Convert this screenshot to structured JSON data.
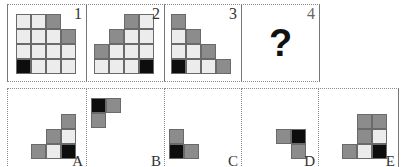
{
  "puzzle": {
    "question_panels": [
      {
        "label": "1",
        "grid": [
          [
            "l",
            "l",
            "g",
            ""
          ],
          [
            "l",
            "l",
            "l",
            "g"
          ],
          [
            "l",
            "l",
            "l",
            "l"
          ],
          [
            "b",
            "l",
            "l",
            "l"
          ]
        ]
      },
      {
        "label": "2",
        "grid": [
          [
            "",
            "",
            "g",
            "l"
          ],
          [
            "",
            "g",
            "l",
            "l"
          ],
          [
            "g",
            "l",
            "l",
            "l"
          ],
          [
            "l",
            "l",
            "l",
            "b"
          ]
        ]
      },
      {
        "label": "3",
        "grid": [
          [
            "g",
            "",
            "",
            ""
          ],
          [
            "l",
            "g",
            "",
            ""
          ],
          [
            "l",
            "l",
            "g",
            ""
          ],
          [
            "b",
            "l",
            "l",
            "g"
          ]
        ]
      },
      {
        "label": "4",
        "content": "?"
      }
    ],
    "options": [
      {
        "label": "A",
        "grid": [
          [
            "",
            "",
            "g"
          ],
          [
            "",
            "g",
            "l"
          ],
          [
            "g",
            "l",
            "b"
          ]
        ]
      },
      {
        "label": "B",
        "grid": [
          [
            "b",
            "g"
          ],
          [
            "g",
            ""
          ]
        ]
      },
      {
        "label": "C",
        "grid": [
          [
            "g",
            ""
          ],
          [
            "b",
            "g"
          ]
        ]
      },
      {
        "label": "D",
        "grid": [
          [
            "g",
            "b"
          ],
          [
            "",
            "g"
          ]
        ]
      },
      {
        "label": "E",
        "grid": [
          [
            "",
            "g",
            "g"
          ],
          [
            "",
            "g",
            "l"
          ],
          [
            "g",
            "l",
            "b"
          ]
        ]
      }
    ],
    "colors": {
      "light": "#ececec",
      "gray": "#8c8c8c",
      "black": "#0d0d0d"
    }
  }
}
